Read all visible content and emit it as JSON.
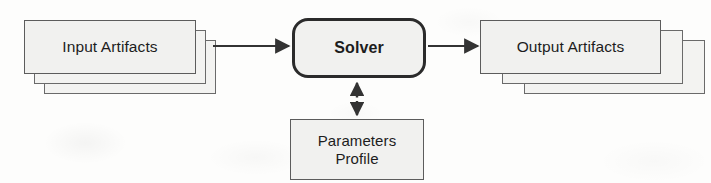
{
  "diagram": {
    "background_color": "#fdfdfc",
    "node_fill_color": "#f1f1ef",
    "node_border_color": "#5c5c5c",
    "accent_border_color": "#2b2b2b",
    "text_color": "#1d1d1d",
    "nodes": [
      {
        "id": "input-artifacts",
        "label": "Input Artifacts",
        "shape": "stacked-rectangle",
        "stack_count": 3
      },
      {
        "id": "solver",
        "label": "Solver",
        "shape": "rounded-rectangle",
        "emphasis": "bold"
      },
      {
        "id": "output-artifacts",
        "label": "Output Artifacts",
        "shape": "stacked-rectangle",
        "stack_count": 3
      },
      {
        "id": "parameters-profile",
        "label": "Parameters\nProfile",
        "line_1": "Parameters",
        "line_2": "Profile",
        "shape": "rectangle"
      }
    ],
    "connectors": [
      {
        "id": "input-to-solver",
        "from": "input-artifacts",
        "to": "solver",
        "style": "solid",
        "arrowheads": "end",
        "direction": "left-to-right"
      },
      {
        "id": "solver-to-output",
        "from": "solver",
        "to": "output-artifacts",
        "style": "solid",
        "arrowheads": "end",
        "direction": "left-to-right"
      },
      {
        "id": "solver-parameters-link",
        "from": "solver",
        "to": "parameters-profile",
        "style": "dotted",
        "arrowheads": "both",
        "direction": "vertical"
      }
    ]
  }
}
